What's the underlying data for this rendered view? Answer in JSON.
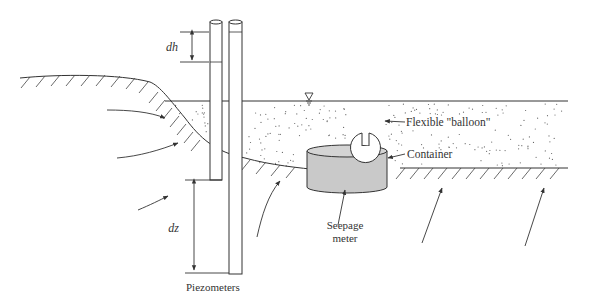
{
  "diagram": {
    "type": "seepage measurement schematic",
    "labels": {
      "dh": "dh",
      "dz": "dz",
      "piezometers": "Piezometers",
      "seepage_meter_line1": "Seepage",
      "seepage_meter_line2": "meter",
      "balloon": "Flexible \"balloon\"",
      "container": "Container"
    },
    "symbols": {
      "water_table": "water-table-triangle"
    },
    "colors": {
      "line": "#333333",
      "container_fill": "#c8c8c8",
      "sediment_dots": "#555555",
      "background": "#ffffff"
    }
  }
}
